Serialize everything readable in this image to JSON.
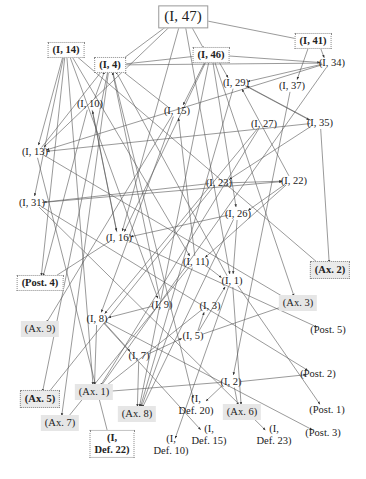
{
  "diagram": {
    "type": "dependency-graph",
    "edge_color": "#555555",
    "nodes": [
      {
        "id": "I47",
        "label": "(I, 47)",
        "x": 183,
        "y": 17,
        "style": "solidbox"
      },
      {
        "id": "I14",
        "label": "(I, 14)",
        "x": 66,
        "y": 50,
        "style": "boxed bold"
      },
      {
        "id": "I4",
        "label": "(I, 4)",
        "x": 110,
        "y": 65,
        "style": "boxed bold"
      },
      {
        "id": "I46",
        "label": "(I, 46)",
        "x": 211,
        "y": 55,
        "style": "boxed bold"
      },
      {
        "id": "I41",
        "label": "(I, 41)",
        "x": 313,
        "y": 41,
        "style": "boxed bold"
      },
      {
        "id": "I34",
        "label": "(I, 34)",
        "x": 332,
        "y": 63,
        "style": ""
      },
      {
        "id": "I29",
        "label": "(I, 29)",
        "x": 236,
        "y": 83,
        "style": ""
      },
      {
        "id": "I37",
        "label": "(I, 37)",
        "x": 292,
        "y": 86,
        "style": ""
      },
      {
        "id": "I10",
        "label": "(I, 10)",
        "x": 90,
        "y": 104,
        "style": ""
      },
      {
        "id": "I15",
        "label": "(I, 15)",
        "x": 177,
        "y": 111,
        "style": ""
      },
      {
        "id": "I27",
        "label": "(I, 27)",
        "x": 264,
        "y": 124,
        "style": ""
      },
      {
        "id": "I35",
        "label": "(I, 35)",
        "x": 320,
        "y": 123,
        "style": ""
      },
      {
        "id": "I13",
        "label": "(I, 13)",
        "x": 35,
        "y": 152,
        "style": ""
      },
      {
        "id": "I23",
        "label": "(I, 23)",
        "x": 219,
        "y": 183,
        "style": ""
      },
      {
        "id": "I22",
        "label": "(I, 22)",
        "x": 294,
        "y": 181,
        "style": ""
      },
      {
        "id": "I31",
        "label": "(I, 31)",
        "x": 32,
        "y": 203,
        "style": ""
      },
      {
        "id": "I26",
        "label": "(I, 26)",
        "x": 238,
        "y": 214,
        "style": ""
      },
      {
        "id": "I16",
        "label": "(I, 16)",
        "x": 119,
        "y": 238,
        "style": ""
      },
      {
        "id": "I11",
        "label": "(I, 11)",
        "x": 196,
        "y": 262,
        "style": ""
      },
      {
        "id": "Ax2",
        "label": "(Ax. 2)",
        "x": 330,
        "y": 270,
        "style": "boxed shaded bold"
      },
      {
        "id": "Post4",
        "label": "(Post. 4)",
        "x": 40,
        "y": 283,
        "style": "boxed bold"
      },
      {
        "id": "I1",
        "label": "(I, 1)",
        "x": 232,
        "y": 281,
        "style": ""
      },
      {
        "id": "I9",
        "label": "(I, 9)",
        "x": 162,
        "y": 305,
        "style": ""
      },
      {
        "id": "I3",
        "label": "(I, 3)",
        "x": 210,
        "y": 306,
        "style": ""
      },
      {
        "id": "Ax3",
        "label": "(Ax. 3)",
        "x": 298,
        "y": 303,
        "style": "shaded"
      },
      {
        "id": "I8",
        "label": "(I, 8)",
        "x": 97,
        "y": 319,
        "style": ""
      },
      {
        "id": "I5",
        "label": "(I, 5)",
        "x": 193,
        "y": 336,
        "style": ""
      },
      {
        "id": "Ax9",
        "label": "(Ax. 9)",
        "x": 40,
        "y": 329,
        "style": "shaded"
      },
      {
        "id": "Post5",
        "label": "(Post. 5)",
        "x": 328,
        "y": 330,
        "style": ""
      },
      {
        "id": "I7",
        "label": "(I, 7)",
        "x": 139,
        "y": 356,
        "style": ""
      },
      {
        "id": "I2",
        "label": "(I, 2)",
        "x": 231,
        "y": 382,
        "style": ""
      },
      {
        "id": "Post2",
        "label": "(Post. 2)",
        "x": 318,
        "y": 374,
        "style": ""
      },
      {
        "id": "Ax1",
        "label": "(Ax. 1)",
        "x": 94,
        "y": 392,
        "style": "shaded"
      },
      {
        "id": "Ax5",
        "label": "(Ax. 5)",
        "x": 40,
        "y": 399,
        "style": "boxed shaded bold"
      },
      {
        "id": "Ax7",
        "label": "(Ax. 7)",
        "x": 60,
        "y": 423,
        "style": "shaded"
      },
      {
        "id": "Ax8",
        "label": "(Ax. 8)",
        "x": 137,
        "y": 414,
        "style": "shaded"
      },
      {
        "id": "Ax6",
        "label": "(Ax. 6)",
        "x": 242,
        "y": 412,
        "style": "shaded"
      },
      {
        "id": "Post1",
        "label": "(Post. 1)",
        "x": 327,
        "y": 410,
        "style": ""
      },
      {
        "id": "Post3",
        "label": "(Post. 3)",
        "x": 323,
        "y": 433,
        "style": ""
      },
      {
        "id": "Def20",
        "label": "(I,\nDef. 20)",
        "x": 196,
        "y": 405,
        "style": ""
      },
      {
        "id": "Def15",
        "label": "(I,\nDef. 15)",
        "x": 209,
        "y": 435,
        "style": ""
      },
      {
        "id": "Def23",
        "label": "(I,\nDef. 23)",
        "x": 274,
        "y": 435,
        "style": ""
      },
      {
        "id": "Def10",
        "label": "(I,\nDef. 10)",
        "x": 171,
        "y": 445,
        "style": ""
      },
      {
        "id": "Def22",
        "label": "(I,\nDef. 22)",
        "x": 112,
        "y": 444,
        "style": "boxed bold"
      }
    ],
    "edges": [
      [
        "I47",
        "I4"
      ],
      [
        "I47",
        "I41"
      ],
      [
        "I47",
        "I46"
      ],
      [
        "I47",
        "I16"
      ],
      [
        "I47",
        "I13"
      ],
      [
        "I47",
        "I1"
      ],
      [
        "I14",
        "I13"
      ],
      [
        "I14",
        "I31"
      ],
      [
        "I14",
        "Post4"
      ],
      [
        "I14",
        "Ax1"
      ],
      [
        "I14",
        "I11"
      ],
      [
        "I14",
        "Ax2"
      ],
      [
        "I14",
        "I9"
      ],
      [
        "I46",
        "I34"
      ],
      [
        "I46",
        "I4"
      ],
      [
        "I46",
        "I29"
      ],
      [
        "I46",
        "I15"
      ],
      [
        "I46",
        "I16"
      ],
      [
        "I46",
        "Ax3"
      ],
      [
        "I46",
        "I26"
      ],
      [
        "I46",
        "Ax8"
      ],
      [
        "I41",
        "I34"
      ],
      [
        "I41",
        "I37"
      ],
      [
        "I34",
        "I29"
      ],
      [
        "I34",
        "I4"
      ],
      [
        "I34",
        "I13"
      ],
      [
        "I34",
        "Ax1"
      ],
      [
        "I29",
        "I35"
      ],
      [
        "I29",
        "Ax8"
      ],
      [
        "I37",
        "I2"
      ],
      [
        "I35",
        "I29"
      ],
      [
        "I35",
        "I23"
      ],
      [
        "I35",
        "Ax2"
      ],
      [
        "I35",
        "I13"
      ],
      [
        "I10",
        "I4"
      ],
      [
        "I10",
        "Post4"
      ],
      [
        "I15",
        "I4"
      ],
      [
        "I15",
        "Ax9"
      ],
      [
        "I15",
        "I8"
      ],
      [
        "I27",
        "I8"
      ],
      [
        "I27",
        "Ax1"
      ],
      [
        "I13",
        "I4"
      ],
      [
        "I13",
        "Ax3"
      ],
      [
        "I13",
        "Def22"
      ],
      [
        "I23",
        "I22"
      ],
      [
        "I23",
        "I31"
      ],
      [
        "I23",
        "Ax5"
      ],
      [
        "I22",
        "I26"
      ],
      [
        "I22",
        "I11"
      ],
      [
        "I22",
        "I29"
      ],
      [
        "I26",
        "I16"
      ],
      [
        "I26",
        "Ax8"
      ],
      [
        "I26",
        "I1"
      ],
      [
        "I16",
        "I10"
      ],
      [
        "I16",
        "Post5"
      ],
      [
        "I16",
        "Post4"
      ],
      [
        "I11",
        "I1"
      ],
      [
        "I11",
        "I15"
      ],
      [
        "I11",
        "Ax8"
      ],
      [
        "I11",
        "Ax7"
      ],
      [
        "I1",
        "I4"
      ],
      [
        "I1",
        "Def10"
      ],
      [
        "I1",
        "Post1"
      ],
      [
        "I1",
        "Ax6"
      ],
      [
        "I9",
        "I8"
      ],
      [
        "I9",
        "I4"
      ],
      [
        "I3",
        "Ax1"
      ],
      [
        "I5",
        "I3"
      ],
      [
        "I5",
        "Ax3"
      ],
      [
        "I5",
        "I1"
      ],
      [
        "I8",
        "I7"
      ],
      [
        "I8",
        "Ax1"
      ],
      [
        "I8",
        "Def15"
      ],
      [
        "I8",
        "Post3"
      ],
      [
        "I7",
        "I5"
      ],
      [
        "I7",
        "Ax8"
      ],
      [
        "I2",
        "Post2"
      ],
      [
        "I2",
        "Ax6"
      ],
      [
        "I2",
        "Def20"
      ],
      [
        "I2",
        "Ax1"
      ],
      [
        "I31",
        "I22"
      ],
      [
        "I31",
        "Post2"
      ],
      [
        "I31",
        "Def23"
      ],
      [
        "I10",
        "I16"
      ],
      [
        "I4",
        "Ax5"
      ],
      [
        "I4",
        "Ax7"
      ],
      [
        "I4",
        "Def20"
      ]
    ]
  }
}
